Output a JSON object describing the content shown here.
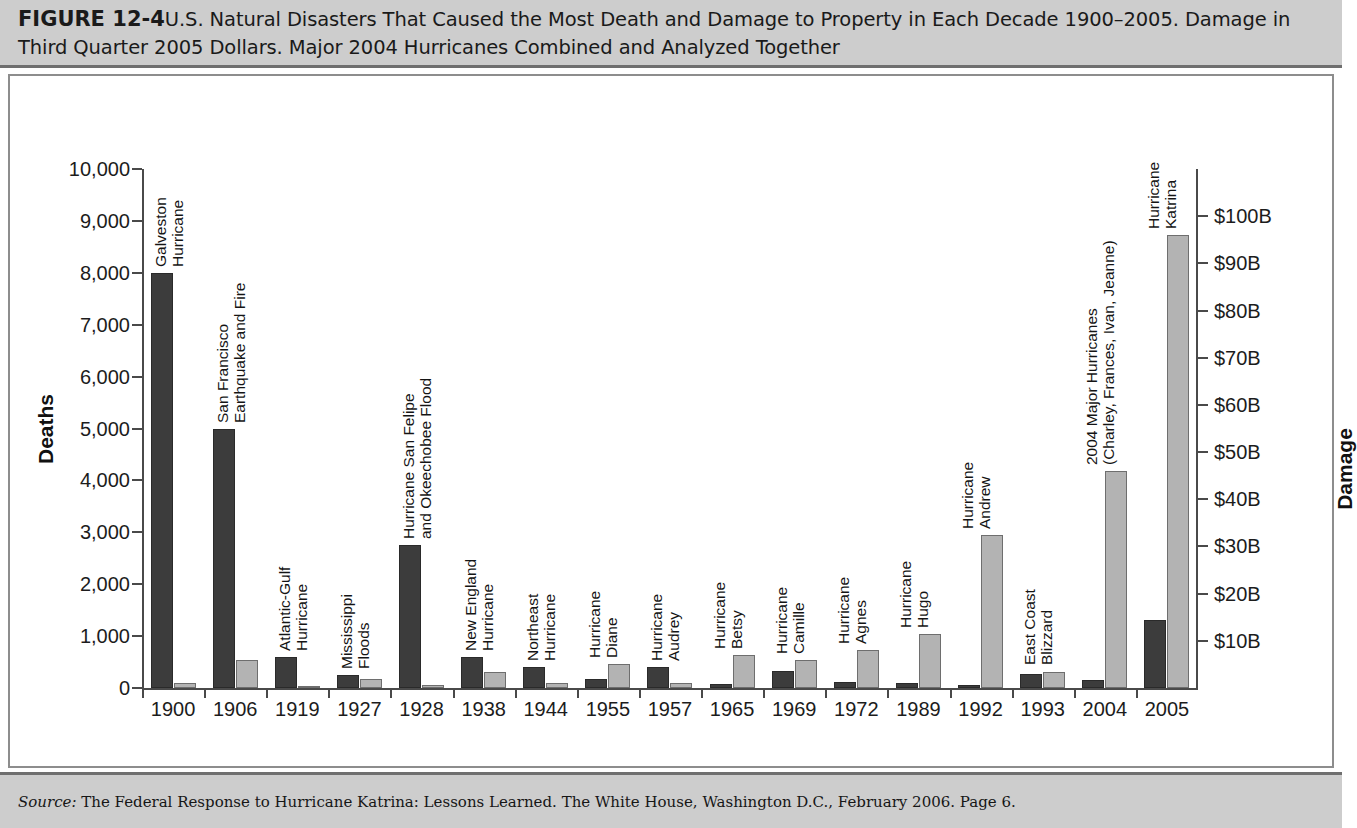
{
  "header": {
    "figure_number": "FIGURE 12-4",
    "title": "U.S. Natural Disasters That Caused the Most Death and Damage to Property in Each Decade 1900–2005. Damage in Third Quarter 2005 Dollars. Major 2004 Hurricanes Combined and Analyzed Together"
  },
  "footer": {
    "source_label": "Source:",
    "source_text": " The Federal Response to Hurricane Katrina: Lessons Learned. The White House, Washington D.C., February 2006. Page 6."
  },
  "colors": {
    "deaths_bar": "#3c3c3c",
    "damage_bar": "#b3b3b3",
    "band_background": "#cdcdcd",
    "frame_border": "#8d8d8d",
    "axis": "#4a4a4a"
  },
  "chart_data": {
    "type": "bar",
    "title": "U.S. Natural Disasters That Caused the Most Death and Damage to Property in Each Decade 1900–2005",
    "xlabel": "",
    "ylabel": "Deaths",
    "y2label": "Damage",
    "grid": false,
    "legend_position": "none",
    "ylim": [
      0,
      10000
    ],
    "yticks": [
      0,
      1000,
      2000,
      3000,
      4000,
      5000,
      6000,
      7000,
      8000,
      9000,
      10000
    ],
    "ytick_labels": [
      "0",
      "1,000",
      "2,000",
      "3,000",
      "4,000",
      "5,000",
      "6,000",
      "7,000",
      "8,000",
      "9,000",
      "10,000"
    ],
    "y2lim": [
      0,
      110
    ],
    "y2ticks": [
      10,
      20,
      30,
      40,
      50,
      60,
      70,
      80,
      90,
      100
    ],
    "y2tick_labels": [
      "$10B",
      "$20B",
      "$30B",
      "$40B",
      "$50B",
      "$60B",
      "$70B",
      "$80B",
      "$90B",
      "$100B"
    ],
    "y2_units": "billions of Third Quarter 2005 dollars",
    "categories": [
      "1900",
      "1906",
      "1919",
      "1927",
      "1928",
      "1938",
      "1944",
      "1955",
      "1957",
      "1965",
      "1969",
      "1972",
      "1989",
      "1992",
      "1993",
      "2004",
      "2005"
    ],
    "point_labels": [
      "Galveston\nHurricane",
      "San Francisco\nEarthquake and Fire",
      "Atlantic-Gulf\nHurricane",
      "Mississippi\nFloods",
      "Hurricane San Felipe\nand Okeechobee Flood",
      "New England\nHurricane",
      "Northeast\nHurricane",
      "Hurricane\nDiane",
      "Hurricane\nAudrey",
      "Hurricane\nBetsy",
      "Hurricane\nCamille",
      "Hurricane\nAgnes",
      "Hurricane\nHugo",
      "Hurricane\nAndrew",
      "East Coast\nBlizzard",
      "2004 Major Hurricanes\n(Charley, Frances, Ivan, Jeanne)",
      "Hurricane\nKatrina"
    ],
    "series": [
      {
        "name": "Deaths",
        "axis": "left",
        "color": "#3c3c3c",
        "values": [
          8000,
          5000,
          600,
          250,
          2750,
          600,
          400,
          180,
          400,
          75,
          320,
          120,
          100,
          60,
          270,
          160,
          1320
        ]
      },
      {
        "name": "Damage",
        "axis": "right",
        "color": "#b3b3b3",
        "values": [
          1,
          6,
          0.5,
          2,
          0.7,
          3.5,
          1,
          5,
          1,
          7,
          6,
          8,
          11.5,
          32.5,
          3.5,
          46,
          96
        ]
      }
    ],
    "rows": [
      {
        "year": "1900",
        "event": "Galveston Hurricane",
        "deaths": 8000,
        "damage_billions": 1
      },
      {
        "year": "1906",
        "event": "San Francisco Earthquake and Fire",
        "deaths": 5000,
        "damage_billions": 6
      },
      {
        "year": "1919",
        "event": "Atlantic-Gulf Hurricane",
        "deaths": 600,
        "damage_billions": 0.5
      },
      {
        "year": "1927",
        "event": "Mississippi Floods",
        "deaths": 250,
        "damage_billions": 2
      },
      {
        "year": "1928",
        "event": "Hurricane San Felipe and Okeechobee Flood",
        "deaths": 2750,
        "damage_billions": 0.7
      },
      {
        "year": "1938",
        "event": "New England Hurricane",
        "deaths": 600,
        "damage_billions": 3.5
      },
      {
        "year": "1944",
        "event": "Northeast Hurricane",
        "deaths": 400,
        "damage_billions": 1
      },
      {
        "year": "1955",
        "event": "Hurricane Diane",
        "deaths": 180,
        "damage_billions": 5
      },
      {
        "year": "1957",
        "event": "Hurricane Audrey",
        "deaths": 400,
        "damage_billions": 1
      },
      {
        "year": "1965",
        "event": "Hurricane Betsy",
        "deaths": 75,
        "damage_billions": 7
      },
      {
        "year": "1969",
        "event": "Hurricane Camille",
        "deaths": 320,
        "damage_billions": 6
      },
      {
        "year": "1972",
        "event": "Hurricane Agnes",
        "deaths": 120,
        "damage_billions": 8
      },
      {
        "year": "1989",
        "event": "Hurricane Hugo",
        "deaths": 100,
        "damage_billions": 11.5
      },
      {
        "year": "1992",
        "event": "Hurricane Andrew",
        "deaths": 60,
        "damage_billions": 32.5
      },
      {
        "year": "1993",
        "event": "East Coast Blizzard",
        "deaths": 270,
        "damage_billions": 3.5
      },
      {
        "year": "2004",
        "event": "2004 Major Hurricanes (Charley, Frances, Ivan, Jeanne)",
        "deaths": 160,
        "damage_billions": 46
      },
      {
        "year": "2005",
        "event": "Hurricane Katrina",
        "deaths": 1320,
        "damage_billions": 96
      }
    ]
  }
}
